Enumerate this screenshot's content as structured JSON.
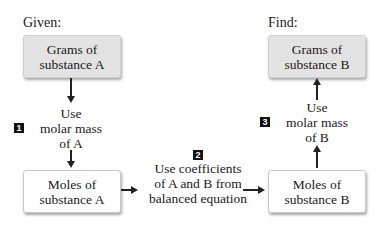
{
  "labels": {
    "given": "Given:",
    "find": "Find:"
  },
  "boxes": {
    "grams_a": [
      "Grams of",
      "substance A"
    ],
    "moles_a": [
      "Moles of",
      "substance A"
    ],
    "grams_b": [
      "Grams of",
      "substance B"
    ],
    "moles_b": [
      "Moles of",
      "substance B"
    ]
  },
  "steps": [
    {
      "number": "1",
      "lines": [
        "Use",
        "molar mass",
        "of A"
      ]
    },
    {
      "number": "2",
      "lines": [
        "Use coefficients",
        "of A and B from",
        "balanced equation"
      ]
    },
    {
      "number": "3",
      "lines": [
        "Use",
        "molar mass",
        "of B"
      ]
    }
  ]
}
